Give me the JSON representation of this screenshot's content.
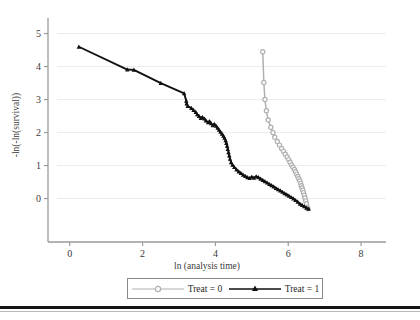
{
  "chart_data": {
    "type": "line",
    "title": "",
    "subtitle": "",
    "xlabel": "ln (analysis time)",
    "ylabel": "-ln(-ln(survival))",
    "xlim": [
      -0.35,
      8.3
    ],
    "ylim": [
      -0.62,
      5.35
    ],
    "xticks": [
      0,
      2,
      4,
      6,
      8
    ],
    "yticks": [
      0,
      1,
      2,
      3,
      4,
      5
    ],
    "xtick_labels": [
      "0",
      "2",
      "4",
      "6",
      "8"
    ],
    "ytick_labels": [
      "0",
      "1",
      "2",
      "3",
      "4",
      "5"
    ],
    "grid": true,
    "grid_axis": "y",
    "legend_position": "below-center",
    "series": [
      {
        "name": "Treat = 0",
        "color": "#b0b0b0",
        "marker": "circle",
        "marker_style": "open-circle",
        "points": [
          [
            5.3,
            4.45
          ],
          [
            5.33,
            3.52
          ],
          [
            5.36,
            3.0
          ],
          [
            5.4,
            2.66
          ],
          [
            5.45,
            2.38
          ],
          [
            5.52,
            2.16
          ],
          [
            5.58,
            2.0
          ],
          [
            5.63,
            1.86
          ],
          [
            5.7,
            1.73
          ],
          [
            5.76,
            1.62
          ],
          [
            5.82,
            1.52
          ],
          [
            5.87,
            1.43
          ],
          [
            5.92,
            1.34
          ],
          [
            5.97,
            1.26
          ],
          [
            6.01,
            1.18
          ],
          [
            6.05,
            1.1
          ],
          [
            6.09,
            1.02
          ],
          [
            6.13,
            0.95
          ],
          [
            6.17,
            0.88
          ],
          [
            6.2,
            0.81
          ],
          [
            6.23,
            0.74
          ],
          [
            6.26,
            0.67
          ],
          [
            6.29,
            0.6
          ],
          [
            6.32,
            0.53
          ],
          [
            6.34,
            0.46
          ],
          [
            6.36,
            0.39
          ],
          [
            6.38,
            0.32
          ],
          [
            6.4,
            0.25
          ],
          [
            6.42,
            0.18
          ],
          [
            6.44,
            0.1
          ],
          [
            6.46,
            0.02
          ],
          [
            6.48,
            -0.07
          ],
          [
            6.5,
            -0.16
          ],
          [
            6.52,
            -0.26
          ],
          [
            6.54,
            -0.31
          ]
        ]
      },
      {
        "name": "Treat = 1",
        "color": "#101010",
        "marker": "triangle",
        "marker_style": "filled-triangle",
        "points": [
          [
            0.25,
            4.6
          ],
          [
            1.58,
            3.91
          ],
          [
            1.76,
            3.9
          ],
          [
            2.5,
            3.5
          ],
          [
            3.14,
            3.19
          ],
          [
            3.2,
            2.96
          ],
          [
            3.21,
            2.88
          ],
          [
            3.24,
            2.8
          ],
          [
            3.34,
            2.74
          ],
          [
            3.4,
            2.68
          ],
          [
            3.46,
            2.62
          ],
          [
            3.5,
            2.55
          ],
          [
            3.55,
            2.5
          ],
          [
            3.6,
            2.44
          ],
          [
            3.64,
            2.47
          ],
          [
            3.7,
            2.42
          ],
          [
            3.74,
            2.36
          ],
          [
            3.8,
            2.31
          ],
          [
            3.84,
            2.34
          ],
          [
            3.88,
            2.28
          ],
          [
            3.93,
            2.22
          ],
          [
            3.97,
            2.26
          ],
          [
            4.02,
            2.2
          ],
          [
            4.06,
            2.14
          ],
          [
            4.1,
            2.08
          ],
          [
            4.14,
            2.02
          ],
          [
            4.18,
            1.96
          ],
          [
            4.22,
            1.9
          ],
          [
            4.25,
            1.84
          ],
          [
            4.28,
            1.76
          ],
          [
            4.3,
            1.68
          ],
          [
            4.32,
            1.6
          ],
          [
            4.34,
            1.5
          ],
          [
            4.36,
            1.4
          ],
          [
            4.38,
            1.3
          ],
          [
            4.4,
            1.2
          ],
          [
            4.43,
            1.1
          ],
          [
            4.47,
            1.02
          ],
          [
            4.52,
            0.95
          ],
          [
            4.58,
            0.88
          ],
          [
            4.64,
            0.82
          ],
          [
            4.7,
            0.77
          ],
          [
            4.76,
            0.72
          ],
          [
            4.82,
            0.68
          ],
          [
            4.88,
            0.64
          ],
          [
            4.94,
            0.62
          ],
          [
            5.0,
            0.66
          ],
          [
            5.06,
            0.63
          ],
          [
            5.12,
            0.67
          ],
          [
            5.18,
            0.64
          ],
          [
            5.24,
            0.6
          ],
          [
            5.3,
            0.56
          ],
          [
            5.36,
            0.52
          ],
          [
            5.42,
            0.48
          ],
          [
            5.48,
            0.44
          ],
          [
            5.54,
            0.4
          ],
          [
            5.6,
            0.36
          ],
          [
            5.66,
            0.32
          ],
          [
            5.72,
            0.28
          ],
          [
            5.78,
            0.24
          ],
          [
            5.84,
            0.2
          ],
          [
            5.9,
            0.16
          ],
          [
            5.96,
            0.12
          ],
          [
            6.02,
            0.08
          ],
          [
            6.08,
            0.04
          ],
          [
            6.14,
            0.0
          ],
          [
            6.2,
            -0.05
          ],
          [
            6.26,
            -0.1
          ],
          [
            6.32,
            -0.16
          ],
          [
            6.38,
            -0.2
          ],
          [
            6.44,
            -0.24
          ],
          [
            6.5,
            -0.28
          ],
          [
            6.56,
            -0.31
          ]
        ]
      }
    ]
  },
  "legend": {
    "items": [
      {
        "label": "Treat = 0"
      },
      {
        "label": "Treat = 1"
      }
    ]
  }
}
